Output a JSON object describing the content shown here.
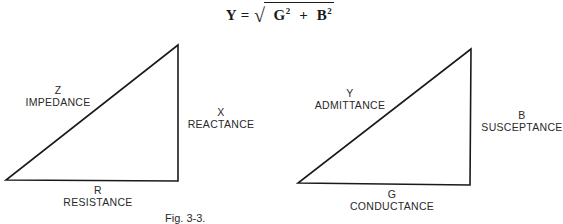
{
  "formula": {
    "lhs": "Y",
    "equals": "=",
    "radical": "√",
    "term1": "G",
    "exp1": "2",
    "plus": "+",
    "term2": "B",
    "exp2": "2"
  },
  "impedance_triangle": {
    "hypotenuse": {
      "symbol": "Z",
      "name": "IMPEDANCE"
    },
    "vertical": {
      "symbol": "X",
      "name": "REACTANCE"
    },
    "base": {
      "symbol": "R",
      "name": "RESISTANCE"
    }
  },
  "admittance_triangle": {
    "hypotenuse": {
      "symbol": "Y",
      "name": "ADMITTANCE"
    },
    "vertical": {
      "symbol": "B",
      "name": "SUSCEPTANCE"
    },
    "base": {
      "symbol": "G",
      "name": "CONDUCTANCE"
    }
  },
  "colors": {
    "line": "#1a1a1a",
    "text": "#2a2a2a",
    "background": "#ffffff"
  },
  "caption": "Fig. 3-3."
}
